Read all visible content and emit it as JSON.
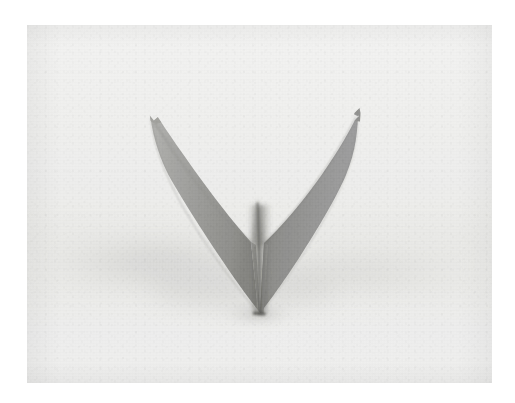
{
  "page": {
    "background_color": "#ffffff",
    "width": 515,
    "height": 403,
    "caption": ""
  },
  "photo": {
    "alt": "Folded paper origami model shaped like the letter V standing upright on a pale gray surface",
    "frame": {
      "left": 27,
      "top": 25,
      "width": 465,
      "height": 358
    },
    "background_color": "#efefee",
    "surface_color": "#ececea",
    "shadow_color": "#d9d9d7"
  },
  "subject": {
    "name": "origami-v-fold",
    "label": "Folded paper V shape",
    "paper_light_color": "#a8a8a6",
    "paper_mid_color": "#949492",
    "paper_dark_color": "#83837f",
    "crease_color": "#5f5f5c",
    "edge_color": "#6e6e6b",
    "left_wing_tip": {
      "x": 150,
      "y": 117
    },
    "right_wing_tip": {
      "x": 357,
      "y": 110
    },
    "inner_vertex": {
      "x": 251,
      "y": 196
    },
    "base_point": {
      "x": 259,
      "y": 312
    }
  },
  "colors": {
    "paper_white": "#ffffff",
    "scan_white": "#f1f1f0",
    "midtone_gray": "#8f8f8d"
  }
}
